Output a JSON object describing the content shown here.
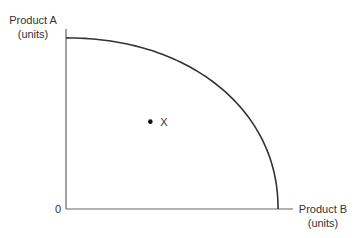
{
  "chart_data": {
    "type": "line",
    "title": "",
    "subtitle": "",
    "ylabel": [
      "Product A",
      "(units)"
    ],
    "xlabel": [
      "Product B",
      "(units)"
    ],
    "origin_label": "0",
    "xlim": [
      0,
      1
    ],
    "ylim": [
      0,
      1
    ],
    "grid": false,
    "legend": "none",
    "series": [
      {
        "name": "production-possibility-frontier",
        "shape": "concave-quarter-curve",
        "x_intercept": 0.93,
        "y_intercept": 0.94
      }
    ],
    "points": [
      {
        "label": "X",
        "x": 0.37,
        "y": 0.48
      }
    ]
  },
  "colors": {
    "axis": "#666666",
    "curve": "#333333",
    "point": "#111111",
    "text": "#333333"
  }
}
